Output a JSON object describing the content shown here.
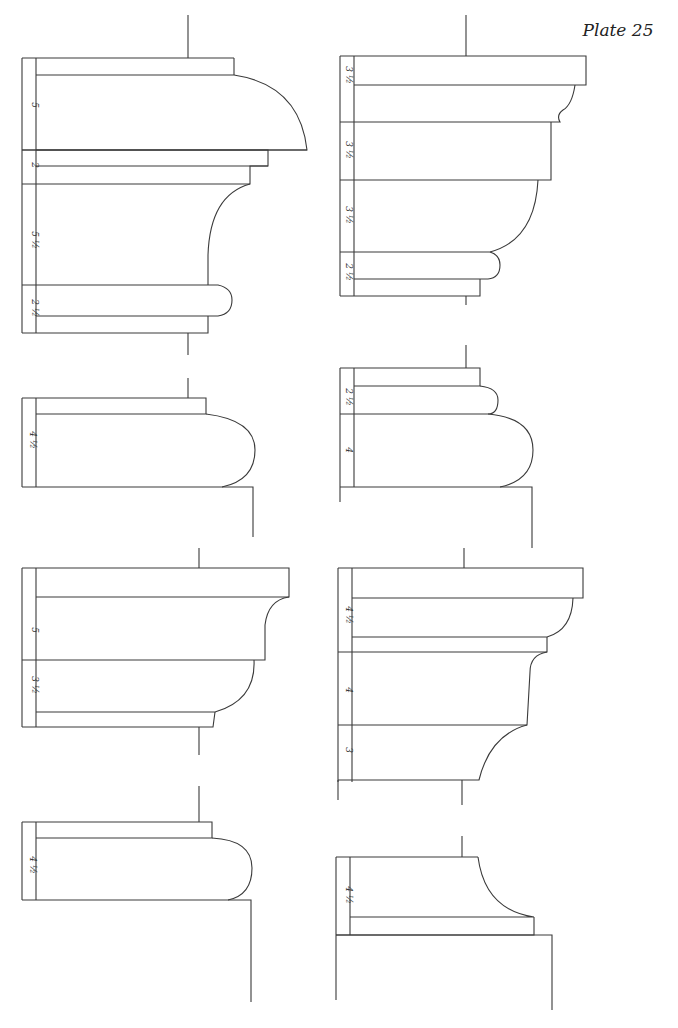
{
  "plate": {
    "title": "Plate 25",
    "ink_color": "#3a3a3a",
    "paper_color": "#ffffff"
  },
  "profiles": [
    {
      "id": "profile-1",
      "position": "top-left",
      "labels": [
        {
          "text": "5",
          "x": 32,
          "y": 105
        },
        {
          "text": "2",
          "x": 32,
          "y": 165
        },
        {
          "text": "5 ½",
          "x": 32,
          "y": 240
        },
        {
          "text": "2 ½",
          "x": 32,
          "y": 308
        }
      ],
      "paths": [
        "M188 15 L188 58",
        "M22 58 L234 58",
        "M234 58 L234 75",
        "M22 58 L22 333",
        "M36 58 L36 333",
        "M36 75 L234 75 Q300 85 307 150 L22 150",
        "M307 150 L22 150",
        "M36 150 L268 150 L268 166 L36 166",
        "M268 166 L250 166 L250 184 L22 184",
        "M250 184 Q210 195 208 255 L208 285",
        "M22 285 L218 285 Q232 288 232 300 Q232 314 218 316 L36 316",
        "M208 316 L208 333 L22 333",
        "M188 333 L188 355"
      ]
    },
    {
      "id": "profile-2",
      "position": "top-right",
      "labels": [
        {
          "text": "3 ½",
          "x": 346,
          "y": 75
        },
        {
          "text": "3 ½",
          "x": 346,
          "y": 150
        },
        {
          "text": "3 ½",
          "x": 346,
          "y": 215
        },
        {
          "text": "2 ½",
          "x": 346,
          "y": 272
        }
      ],
      "paths": [
        "M466 15 L466 56",
        "M340 56 L586 56 L586 85 L354 85",
        "M340 56 L340 296",
        "M354 56 L354 296",
        "M575 85 Q572 105 563 110 Q556 115 560 122 L340 122",
        "M551 122 L551 180 L340 180",
        "M538 180 Q535 240 490 252 L340 252",
        "M490 252 Q500 255 500 265 Q500 278 488 279 L354 279",
        "M480 279 L480 296 L340 296",
        "M466 296 L466 305"
      ]
    },
    {
      "id": "profile-3",
      "position": "second-left",
      "labels": [
        {
          "text": "4 ½",
          "x": 30,
          "y": 440
        }
      ],
      "paths": [
        "M188 378 L188 398",
        "M22 398 L206 398 L206 414 L36 414",
        "M22 398 L22 487",
        "M36 398 L36 487",
        "M206 414 Q255 420 255 450 Q255 480 222 487 L22 487",
        "M222 487 L253 487 L253 537"
      ]
    },
    {
      "id": "profile-4",
      "position": "second-right",
      "labels": [
        {
          "text": "2 ½",
          "x": 346,
          "y": 397
        },
        {
          "text": "4",
          "x": 346,
          "y": 450
        }
      ],
      "paths": [
        "M466 345 L466 368",
        "M340 368 L480 368 L480 386 L354 386",
        "M340 368 L340 487",
        "M354 368 L354 487",
        "M480 386 Q498 388 498 400 Q498 414 488 414 L340 414",
        "M488 414 Q533 418 533 450 Q533 480 500 487 L340 487",
        "M500 487 L532 487 L532 548",
        "M340 487 L340 502"
      ]
    },
    {
      "id": "profile-5",
      "position": "third-left",
      "labels": [
        {
          "text": "5",
          "x": 32,
          "y": 630
        },
        {
          "text": "3 ½",
          "x": 32,
          "y": 685
        }
      ],
      "paths": [
        "M199 548 L199 568",
        "M22 568 L289 568 L289 597 L36 597",
        "M22 568 L22 727",
        "M36 568 L36 727",
        "M289 597 Q268 600 265 625 L265 660 L22 660",
        "M254 660 Q256 700 215 712 L36 712",
        "M215 712 L213 727 L22 727",
        "M199 727 L199 755"
      ]
    },
    {
      "id": "profile-6",
      "position": "third-right",
      "labels": [
        {
          "text": "4 ½",
          "x": 346,
          "y": 615
        },
        {
          "text": "4",
          "x": 346,
          "y": 690
        },
        {
          "text": "3",
          "x": 346,
          "y": 750
        }
      ],
      "paths": [
        "M464 548 L464 568",
        "M338 568 L583 568 L583 598 L352 598",
        "M338 568 L338 782",
        "M352 568 L352 782",
        "M573 598 Q572 630 547 637 L352 637",
        "M547 637 L547 652 L338 652",
        "M547 652 Q530 655 530 672 L527 725 L338 725",
        "M527 725 Q490 735 479 780 L338 780",
        "M462 780 L462 805",
        "M338 780 L338 800"
      ]
    },
    {
      "id": "profile-7",
      "position": "bottom-left",
      "labels": [
        {
          "text": "4 ½",
          "x": 30,
          "y": 865
        }
      ],
      "paths": [
        "M199 786 L199 822",
        "M22 822 L212 822 L212 838 L36 838",
        "M22 822 L22 900",
        "M36 822 L36 900",
        "M212 838 Q252 840 252 868 Q252 895 228 900 L22 900",
        "M228 900 L251 900 L251 1002"
      ]
    },
    {
      "id": "profile-8",
      "position": "bottom-right",
      "labels": [
        {
          "text": "4 ½",
          "x": 346,
          "y": 895
        }
      ],
      "paths": [
        "M462 836 L462 857",
        "M336 857 L478 857",
        "M336 857 L336 935",
        "M350 857 L350 935",
        "M478 857 Q485 910 534 917 L350 917",
        "M534 917 L534 935 L336 935",
        "M336 935 L552 935 L552 1010",
        "M336 935 L336 1000"
      ]
    }
  ]
}
